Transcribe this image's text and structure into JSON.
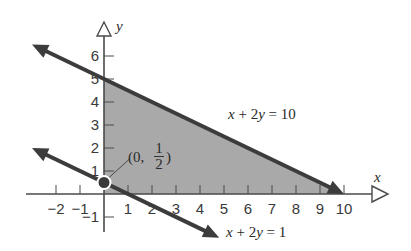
{
  "chart_data": {
    "type": "area",
    "title": "",
    "xlabel": "x",
    "ylabel": "y",
    "xlim": [
      -2.5,
      11
    ],
    "ylim": [
      -1.5,
      7
    ],
    "x_ticks": [
      -2,
      -1,
      1,
      2,
      3,
      4,
      5,
      6,
      7,
      8,
      9,
      10
    ],
    "x_tick_labels": [
      "−2",
      "−1",
      "1",
      "2",
      "3",
      "4",
      "5",
      "6",
      "7",
      "8",
      "9",
      "10"
    ],
    "y_ticks": [
      -1,
      1,
      2,
      3,
      4,
      5,
      6
    ],
    "y_tick_labels": [
      "−1",
      "1",
      "2",
      "3",
      "4",
      "5",
      "6"
    ],
    "lines": [
      {
        "name": "line-x-plus-2y-eq-10",
        "label_parts": [
          "x",
          " + 2",
          "y",
          " = 10"
        ],
        "a": 1,
        "b": 2,
        "c": 10,
        "x_range": [
          -3.0,
          10.0
        ]
      },
      {
        "name": "line-x-plus-2y-eq-1",
        "label_parts": [
          "x",
          " + 2",
          "y",
          " = 1"
        ],
        "a": 1,
        "b": 2,
        "c": 1,
        "x_range": [
          -3.0,
          4.8
        ]
      }
    ],
    "shaded_region": {
      "vertices": [
        [
          0,
          0
        ],
        [
          10,
          0
        ],
        [
          0,
          5
        ]
      ],
      "color": "#a8a8a8"
    },
    "points": [
      {
        "x": 0,
        "y": 0.5,
        "label_open": "(0,",
        "label_num": "1",
        "label_den": "2",
        "label_close": ")"
      }
    ],
    "grid": false
  },
  "colors": {
    "line": "#3c3c3c",
    "axis": "#4a4a4a",
    "fill": "#a9a9a9",
    "text": "#333333"
  }
}
